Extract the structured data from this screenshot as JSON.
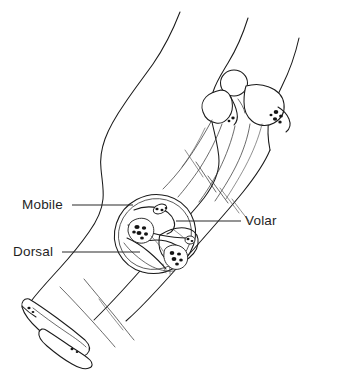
{
  "figure": {
    "background_color": "#ffffff",
    "line_color": "#1a1a1a",
    "text_color": "#1f1f1f",
    "width": 344,
    "height": 373
  },
  "labels": [
    {
      "id": "mobile",
      "text": "Mobile",
      "x": 22,
      "y": 198,
      "leader": {
        "x1": 72,
        "y1": 205,
        "x2": 133,
        "y2": 205
      }
    },
    {
      "id": "dorsal",
      "text": "Dorsal",
      "x": 13,
      "y": 245,
      "leader": {
        "x1": 62,
        "y1": 252,
        "x2": 140,
        "y2": 252
      }
    },
    {
      "id": "volar",
      "text": "Volar",
      "x": 245,
      "y": 214,
      "leader": {
        "x1": 176,
        "y1": 221,
        "x2": 241,
        "y2": 221
      }
    }
  ],
  "cross_section": {
    "center_x": 155,
    "center_y": 234,
    "radius_x": 41,
    "radius_y": 39,
    "rotation_deg": -28,
    "compartments": [
      "Mobile",
      "Volar",
      "Dorsal"
    ],
    "bones_shown": 2
  },
  "structures": [
    {
      "name": "limb-outline-lateral",
      "type": "contour"
    },
    {
      "name": "limb-outline-medial",
      "type": "contour"
    },
    {
      "name": "proximal-joint-bones",
      "type": "bone-group"
    },
    {
      "name": "distal-bone-end",
      "type": "bone-group"
    },
    {
      "name": "cross-section-circle",
      "type": "section"
    },
    {
      "name": "muscle-fascia-lines",
      "type": "detail"
    }
  ]
}
